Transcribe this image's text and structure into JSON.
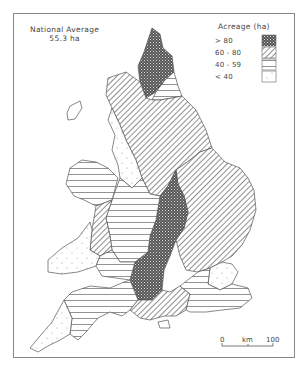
{
  "map": {
    "title_line1": "National Average",
    "title_line2": "55.3 ha",
    "legend": {
      "title": "Acreage (ha)",
      "items": [
        {
          "label": "> 80",
          "pattern": "crosshatch-dark"
        },
        {
          "label": "60 - 80",
          "pattern": "diagonal-hatch"
        },
        {
          "label": "40 - 59",
          "pattern": "horizontal-lines"
        },
        {
          "label": "< 40",
          "pattern": "dots"
        }
      ]
    },
    "scale": {
      "start": "0",
      "unit": "km",
      "end": "100"
    }
  }
}
